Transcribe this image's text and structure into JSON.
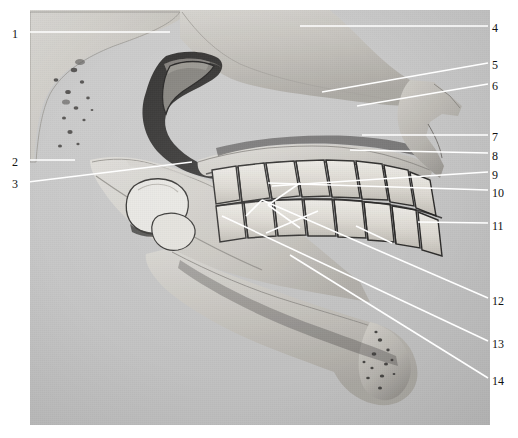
{
  "figure": {
    "kind": "anatomical-photograph",
    "plate": {
      "background_color": "#c8c8c8",
      "left": 30,
      "top": 10,
      "width": 460,
      "height": 415
    },
    "page_background": "#ffffff",
    "leader_color": "#ffffff",
    "label_color": "#111111"
  },
  "labels": [
    {
      "id": "1",
      "text": "1",
      "side": "left",
      "x": 18,
      "y": 34,
      "line": {
        "x1": 28,
        "y1": 32,
        "x2": 170,
        "y2": 32
      }
    },
    {
      "id": "2",
      "text": "2",
      "side": "left",
      "x": 18,
      "y": 162,
      "line": {
        "x1": 28,
        "y1": 160,
        "x2": 75,
        "y2": 160
      }
    },
    {
      "id": "3",
      "text": "3",
      "side": "left",
      "x": 18,
      "y": 184,
      "line": {
        "x1": 28,
        "y1": 182,
        "x2": 192,
        "y2": 162
      }
    },
    {
      "id": "4",
      "text": "4",
      "side": "right",
      "x": 492,
      "y": 28,
      "line": {
        "x1": 488,
        "y1": 26,
        "x2": 300,
        "y2": 26
      }
    },
    {
      "id": "5",
      "text": "5",
      "side": "right",
      "x": 492,
      "y": 65,
      "line": {
        "x1": 488,
        "y1": 63,
        "x2": 322,
        "y2": 92
      }
    },
    {
      "id": "6",
      "text": "6",
      "side": "right",
      "x": 492,
      "y": 86,
      "line": {
        "x1": 488,
        "y1": 84,
        "x2": 357,
        "y2": 106
      }
    },
    {
      "id": "7",
      "text": "7",
      "side": "right",
      "x": 492,
      "y": 137,
      "line": {
        "x1": 488,
        "y1": 135,
        "x2": 362,
        "y2": 135
      }
    },
    {
      "id": "8",
      "text": "8",
      "side": "right",
      "x": 492,
      "y": 156,
      "line": {
        "x1": 488,
        "y1": 153,
        "x2": 350,
        "y2": 150
      }
    },
    {
      "id": "9",
      "text": "9",
      "side": "right",
      "x": 492,
      "y": 175,
      "line": {
        "x1": 488,
        "y1": 172,
        "x2": 272,
        "y2": 186
      }
    },
    {
      "id": "10",
      "text": "10",
      "side": "right",
      "x": 492,
      "y": 193,
      "line": {
        "x1": 488,
        "y1": 190,
        "x2": 268,
        "y2": 183
      }
    },
    {
      "id": "11",
      "text": "11",
      "side": "right",
      "x": 492,
      "y": 226,
      "line": {
        "x1": 488,
        "y1": 223,
        "x2": 418,
        "y2": 222
      }
    },
    {
      "id": "12",
      "text": "12",
      "side": "right",
      "x": 492,
      "y": 301,
      "line": {
        "x1": 488,
        "y1": 298,
        "x2": 262,
        "y2": 200
      }
    },
    {
      "id": "13",
      "text": "13",
      "side": "right",
      "x": 492,
      "y": 344,
      "line": {
        "x1": 488,
        "y1": 341,
        "x2": 222,
        "y2": 216
      }
    },
    {
      "id": "14",
      "text": "14",
      "side": "right",
      "x": 492,
      "y": 381,
      "line": {
        "x1": 488,
        "y1": 378,
        "x2": 290,
        "y2": 255
      }
    }
  ],
  "extra_leaders": [
    {
      "id": "e1",
      "x1": 300,
      "y1": 183,
      "x2": 268,
      "y2": 205
    },
    {
      "id": "e2",
      "x1": 318,
      "y1": 211,
      "x2": 266,
      "y2": 233
    },
    {
      "id": "e3",
      "x1": 268,
      "y1": 205,
      "x2": 300,
      "y2": 228
    },
    {
      "id": "e4",
      "x1": 262,
      "y1": 200,
      "x2": 246,
      "y2": 216
    },
    {
      "id": "e5",
      "x1": 356,
      "y1": 226,
      "x2": 392,
      "y2": 243
    }
  ]
}
